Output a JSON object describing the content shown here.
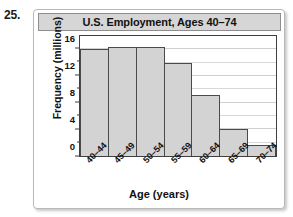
{
  "problem": {
    "number": "25."
  },
  "chart_data": {
    "type": "bar",
    "title": "U.S. Employment, Ages 40–74",
    "xlabel": "Age (years)",
    "ylabel": "Frequency (millions)",
    "categories": [
      "40–44",
      "45–49",
      "50–54",
      "55–59",
      "60–64",
      "65–69",
      "70–74"
    ],
    "values": [
      16.0,
      16.3,
      16.4,
      14.0,
      9.2,
      4.1,
      1.7
    ],
    "ylim": [
      0,
      18
    ],
    "xlim_note": "categorical bins, contiguous bars",
    "ytick_labels": [
      "0",
      "4",
      "8",
      "12",
      "16"
    ],
    "ytick_values": [
      0,
      4,
      8,
      12,
      16
    ],
    "yminor_values": [
      2,
      6,
      10,
      14
    ],
    "grid": "horizontal",
    "legend": "none",
    "bar_fill": "#d3d3d3",
    "bar_edge": "#4a4a4a"
  },
  "style": {
    "title_band_bg": "#d6d6d6",
    "panel_border": "#b9b9b9",
    "axis_color": "#3f3f3f",
    "grid_color": "#d8d8d8",
    "text_color": "#111111"
  }
}
